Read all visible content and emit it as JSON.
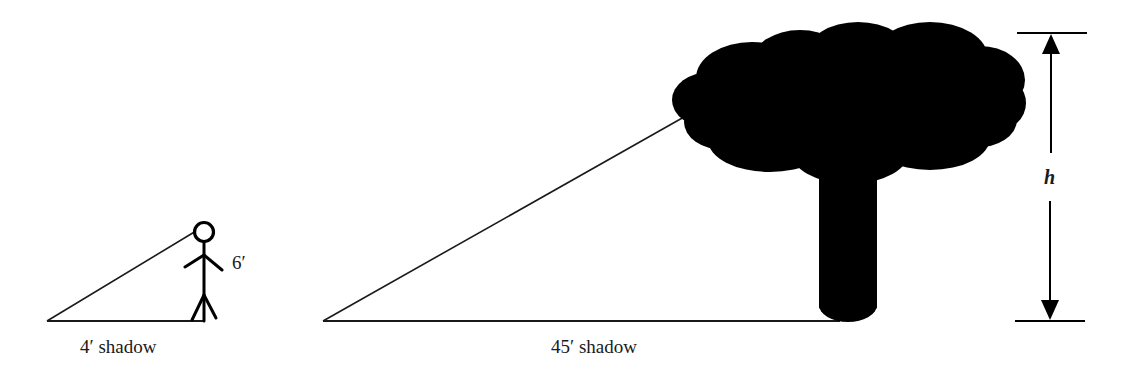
{
  "diagram": {
    "type": "similar-triangles-shadow-problem",
    "person": {
      "height_label": "6′",
      "shadow_label": "4′ shadow",
      "icon": "stick-figure-icon"
    },
    "tree": {
      "height_label": "h",
      "shadow_label": "45′ shadow",
      "icon": "tree-silhouette-icon"
    },
    "colors": {
      "ink": "#000000",
      "line": "#1a1a1a",
      "background": "#ffffff"
    }
  }
}
